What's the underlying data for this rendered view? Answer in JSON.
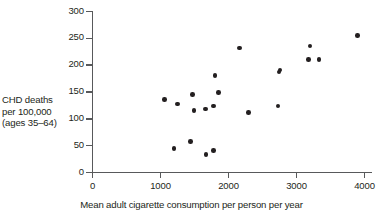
{
  "chart_data": {
    "type": "scatter",
    "title": "",
    "xlabel": "Mean adult cigarette consumption per person per year",
    "ylabel_lines": [
      "CHD deaths",
      "per 100,000",
      "(ages 35–64)"
    ],
    "ylabel": "CHD deaths per 100,000 (ages 35–64)",
    "xlim": [
      0,
      4000
    ],
    "ylim": [
      0,
      300
    ],
    "xticks": [
      0,
      1000,
      2000,
      3000,
      4000
    ],
    "yticks": [
      0,
      50,
      100,
      150,
      200,
      250,
      300
    ],
    "xtick_labels": [
      "0",
      "1000",
      "2000",
      "3000",
      "4000"
    ],
    "ytick_labels": [
      "0",
      "50",
      "100",
      "150",
      "200",
      "250",
      "300"
    ],
    "grid": false,
    "legend": false,
    "marker": "filled-circle",
    "marker_color": "#231f20",
    "axis_color": "#58595b",
    "points": [
      {
        "x": 1060,
        "y": 136
      },
      {
        "x": 1250,
        "y": 128
      },
      {
        "x": 1470,
        "y": 145
      },
      {
        "x": 1490,
        "y": 115
      },
      {
        "x": 1660,
        "y": 118
      },
      {
        "x": 1780,
        "y": 124
      },
      {
        "x": 1850,
        "y": 149
      },
      {
        "x": 1800,
        "y": 181
      },
      {
        "x": 2160,
        "y": 232
      },
      {
        "x": 2290,
        "y": 112
      },
      {
        "x": 2730,
        "y": 124
      },
      {
        "x": 2740,
        "y": 187
      },
      {
        "x": 2760,
        "y": 191
      },
      {
        "x": 3200,
        "y": 236
      },
      {
        "x": 3180,
        "y": 211
      },
      {
        "x": 3330,
        "y": 211
      },
      {
        "x": 3900,
        "y": 255
      },
      {
        "x": 1200,
        "y": 45
      },
      {
        "x": 1440,
        "y": 58
      },
      {
        "x": 1670,
        "y": 33
      },
      {
        "x": 1780,
        "y": 41
      }
    ]
  }
}
